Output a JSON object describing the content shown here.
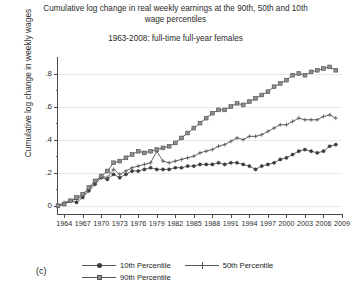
{
  "title": {
    "line1": "Cumulative log change in real weekly earnings at the 90th, 50th and 10th",
    "line2": "wage percentiles",
    "subtitle": "1963-2008: full-time full-year  females"
  },
  "panel_tag": "(c)",
  "axes": {
    "ylabel": "Cumulative log change in weekly wages",
    "ytick_labels": [
      "0",
      ".2",
      ".4",
      ".6",
      ".8"
    ],
    "xtick_labels": [
      "1964",
      "1967",
      "1970",
      "1973",
      "1976",
      "1979",
      "1982",
      "1985",
      "1988",
      "1991",
      "1994",
      "1997",
      "2000",
      "2003",
      "2006",
      "2009"
    ]
  },
  "legend": {
    "items": [
      {
        "label": "10th Percentile",
        "marker": "circle-marker",
        "color": "#3a3a3a"
      },
      {
        "label": "50th Percentile",
        "marker": "plus-marker",
        "color": "#555555"
      },
      {
        "label": "90th Percentile",
        "marker": "square-marker",
        "color": "#8d8d8d"
      }
    ]
  },
  "chart_data": {
    "type": "line",
    "title": "Cumulative log change in real weekly earnings at the 90th, 50th and 10th wage percentiles",
    "subtitle": "1963-2008: full-time full-year  females",
    "xlabel": "",
    "ylabel": "Cumulative log change in weekly wages",
    "xlim": [
      1963,
      2009
    ],
    "ylim": [
      -0.05,
      0.9
    ],
    "yticks": [
      0,
      0.2,
      0.4,
      0.6,
      0.8
    ],
    "xticks": [
      1964,
      1967,
      1970,
      1973,
      1976,
      1979,
      1982,
      1985,
      1988,
      1991,
      1994,
      1997,
      2000,
      2003,
      2006,
      2009
    ],
    "grid": "horizontal",
    "legend_position": "below",
    "x": [
      1963,
      1964,
      1965,
      1966,
      1967,
      1968,
      1969,
      1970,
      1971,
      1972,
      1973,
      1974,
      1975,
      1976,
      1977,
      1978,
      1979,
      1980,
      1981,
      1982,
      1983,
      1984,
      1985,
      1986,
      1987,
      1988,
      1989,
      1990,
      1991,
      1992,
      1993,
      1994,
      1995,
      1996,
      1997,
      1998,
      1999,
      2000,
      2001,
      2002,
      2003,
      2004,
      2005,
      2006,
      2007,
      2008
    ],
    "series": [
      {
        "name": "10th Percentile",
        "marker": "circle",
        "color": "#3a3a3a",
        "values": [
          0.0,
          0.01,
          0.03,
          0.02,
          0.05,
          0.09,
          0.13,
          0.17,
          0.16,
          0.19,
          0.17,
          0.19,
          0.21,
          0.21,
          0.22,
          0.23,
          0.22,
          0.22,
          0.22,
          0.23,
          0.23,
          0.24,
          0.24,
          0.25,
          0.25,
          0.25,
          0.26,
          0.25,
          0.26,
          0.26,
          0.25,
          0.24,
          0.22,
          0.24,
          0.25,
          0.26,
          0.28,
          0.29,
          0.31,
          0.33,
          0.34,
          0.33,
          0.32,
          0.33,
          0.36,
          0.37
        ]
      },
      {
        "name": "50th Percentile",
        "marker": "plus",
        "color": "#555555",
        "values": [
          0.0,
          0.02,
          0.03,
          0.04,
          0.06,
          0.1,
          0.14,
          0.18,
          0.17,
          0.22,
          0.19,
          0.21,
          0.23,
          0.24,
          0.25,
          0.26,
          0.33,
          0.27,
          0.26,
          0.27,
          0.28,
          0.29,
          0.3,
          0.32,
          0.33,
          0.34,
          0.36,
          0.37,
          0.39,
          0.41,
          0.4,
          0.42,
          0.42,
          0.43,
          0.45,
          0.47,
          0.49,
          0.49,
          0.51,
          0.53,
          0.52,
          0.52,
          0.52,
          0.54,
          0.55,
          0.53
        ]
      },
      {
        "name": "90th Percentile",
        "marker": "square",
        "color": "#8d8d8d",
        "values": [
          0.0,
          0.01,
          0.03,
          0.05,
          0.07,
          0.11,
          0.15,
          0.18,
          0.21,
          0.26,
          0.27,
          0.29,
          0.31,
          0.33,
          0.32,
          0.33,
          0.34,
          0.35,
          0.36,
          0.38,
          0.41,
          0.44,
          0.47,
          0.5,
          0.53,
          0.56,
          0.58,
          0.58,
          0.6,
          0.62,
          0.61,
          0.63,
          0.65,
          0.67,
          0.69,
          0.72,
          0.74,
          0.76,
          0.79,
          0.8,
          0.79,
          0.81,
          0.82,
          0.83,
          0.84,
          0.82
        ]
      }
    ]
  }
}
